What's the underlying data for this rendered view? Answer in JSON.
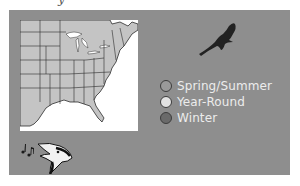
{
  "header": {
    "title_fragment": "y"
  },
  "map": {
    "region": "Eastern United States",
    "colors": {
      "land": "#c4c4c4",
      "water": "#ffffff",
      "borders": "#2c2c2c",
      "panel": "#8e8e8e"
    }
  },
  "legend": {
    "items": [
      {
        "label": "Spring/Summer",
        "color": "#9a9a9a"
      },
      {
        "label": "Year-Round",
        "color": "#e2e2e2"
      },
      {
        "label": "Winter",
        "color": "#6a6a6a"
      }
    ]
  },
  "icons": {
    "hawk": "hawk-silhouette-icon",
    "songbird": "singing-bird-icon"
  }
}
